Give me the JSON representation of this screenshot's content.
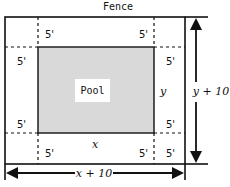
{
  "title": "Fence",
  "pool": {
    "label": "Pool",
    "fill": "#d9d9d9"
  },
  "margins": {
    "top_left": "5'",
    "top_right": "5'",
    "left_upper": "5'",
    "right_upper": "5'",
    "left_lower": "5'",
    "right_lower": "5'",
    "bottom_left": "5'",
    "bottom_mid_right": "5'",
    "bottom_right": "5'"
  },
  "dimensions": {
    "pool_width": "x",
    "pool_height": "y",
    "total_width": "x + 10",
    "total_height": "y + 10"
  }
}
